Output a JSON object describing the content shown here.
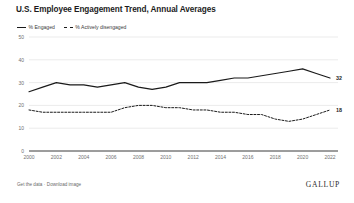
{
  "chart_title": "U.S. Employee Engagement Trend, Annual Averages",
  "legend": {
    "position": "top-left",
    "entries": [
      {
        "label": "% Engaged",
        "style": "solid"
      },
      {
        "label": "% Actively disengaged",
        "style": "dashed"
      }
    ]
  },
  "footer": {
    "get_data_label": "Get the data",
    "separator": "·",
    "download_label": "Download image",
    "brand": "GALLUP"
  },
  "axis": {
    "y_ticks": [
      "50",
      "40",
      "30",
      "20",
      "10",
      "0"
    ],
    "x_ticks": [
      "2000",
      "2002",
      "2004",
      "2006",
      "2008",
      "2010",
      "2012",
      "2014",
      "2016",
      "2018",
      "2020",
      "2022"
    ]
  },
  "end_labels": {
    "engaged": "32",
    "disengaged": "18"
  },
  "chart_data": {
    "type": "line",
    "title": "U.S. Employee Engagement Trend, Annual Averages",
    "xlabel": "",
    "ylabel": "",
    "xlim": [
      2000,
      2022
    ],
    "ylim": [
      0,
      50
    ],
    "grid": true,
    "legend_position": "top-left",
    "x": [
      2000,
      2001,
      2002,
      2003,
      2004,
      2005,
      2006,
      2007,
      2008,
      2009,
      2010,
      2011,
      2012,
      2013,
      2014,
      2015,
      2016,
      2017,
      2018,
      2019,
      2020,
      2021,
      2022
    ],
    "series": [
      {
        "name": "% Engaged",
        "style": "solid",
        "color": "#1a1a1a",
        "end_label": "32",
        "values": [
          26,
          28,
          30,
          29,
          29,
          28,
          29,
          30,
          28,
          27,
          28,
          30,
          30,
          30,
          31,
          32,
          32,
          33,
          34,
          35,
          36,
          34,
          32
        ]
      },
      {
        "name": "% Actively disengaged",
        "style": "dashed",
        "color": "#1a1a1a",
        "end_label": "18",
        "values": [
          18,
          17,
          17,
          17,
          17,
          17,
          17,
          19,
          20,
          20,
          19,
          19,
          18,
          18,
          17,
          17,
          16,
          16,
          14,
          13,
          14,
          16,
          18
        ]
      }
    ]
  }
}
